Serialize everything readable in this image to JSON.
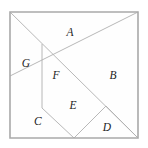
{
  "figure": {
    "kind": "tangram-dissection",
    "canvas": {
      "width": 148,
      "height": 148,
      "background": "#ffffff"
    },
    "square": {
      "x": 10,
      "y": 12,
      "size": 128
    },
    "colors": {
      "outline": "#a9a9a9",
      "cut_line": "#b0b0b0",
      "face": "#fefefe",
      "label": "#1d1d1d"
    },
    "outline_path": "M10,12 L138,12 L138,138 L10,138 Z",
    "cut_paths": [
      "M10,12 L138,138",
      "M138,12 L10,76",
      "M42,44 L42,108",
      "M42,108 L74,138",
      "M74,138 L106,106",
      "M106,106 L138,138"
    ],
    "labels": [
      {
        "id": "A",
        "text": "A",
        "x": 70,
        "y": 33
      },
      {
        "id": "B",
        "text": "B",
        "x": 113,
        "y": 76
      },
      {
        "id": "C",
        "text": "C",
        "x": 38,
        "y": 122
      },
      {
        "id": "D",
        "text": "D",
        "x": 107,
        "y": 128
      },
      {
        "id": "E",
        "text": "E",
        "x": 73,
        "y": 106
      },
      {
        "id": "F",
        "text": "F",
        "x": 56,
        "y": 76
      },
      {
        "id": "G",
        "text": "G",
        "x": 26,
        "y": 64
      }
    ],
    "pieces": [
      {
        "id": "A",
        "name": "large-triangle-top",
        "points": "10,12 138,12 74,76"
      },
      {
        "id": "B",
        "name": "large-triangle-right",
        "points": "138,12 138,138 106,106 74,76"
      },
      {
        "id": "C",
        "name": "large-triangle-bottom-left",
        "points": "10,76 10,138 74,138 42,108"
      },
      {
        "id": "D",
        "name": "small-triangle-bottom-right",
        "points": "74,138 106,106 138,138"
      },
      {
        "id": "E",
        "name": "medium-triangle-center-bottom",
        "points": "42,108 74,76 106,106 74,138"
      },
      {
        "id": "F",
        "name": "small-triangle-center",
        "points": "42,44 74,76 42,108"
      },
      {
        "id": "G",
        "name": "parallelogram-left",
        "points": "10,12 42,44 42,108 10,76"
      }
    ]
  }
}
